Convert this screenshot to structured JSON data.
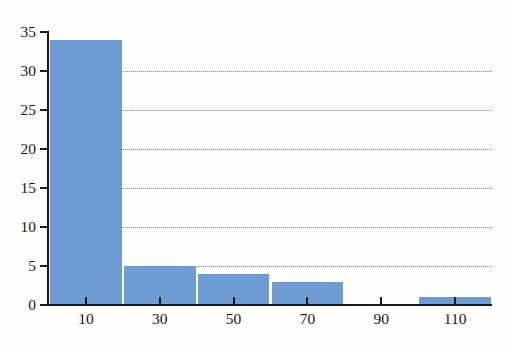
{
  "chart_data": {
    "type": "bar",
    "title": "",
    "subtitle": "",
    "xlabel": "",
    "ylabel": "",
    "xlim": [
      0,
      120
    ],
    "ylim": [
      0,
      35
    ],
    "grid": true,
    "legend": null,
    "bar_color": "#6e9bd1",
    "bin_width": 20,
    "bin_edges": [
      0,
      20,
      40,
      60,
      80,
      100,
      120
    ],
    "categories": [
      "0-20",
      "20-40",
      "40-60",
      "60-80",
      "80-100",
      "100-120"
    ],
    "values": [
      34,
      5,
      4,
      3,
      0,
      1
    ],
    "x_ticks": [
      10,
      30,
      50,
      70,
      90,
      110
    ],
    "x_tick_labels": [
      "10",
      "30",
      "50",
      "70",
      "90",
      "110"
    ],
    "y_ticks": [
      0,
      5,
      10,
      15,
      20,
      25,
      30,
      35
    ],
    "y_tick_labels": [
      "0",
      "5",
      "10",
      "15",
      "20",
      "25",
      "30",
      "35"
    ],
    "gridline_values": [
      5,
      10,
      15,
      20,
      25,
      30
    ]
  },
  "colors": {
    "background": "#fdfdfa",
    "axis": "#1b1b1b",
    "gridline": "#8a8a8a",
    "bar_fill": "#6e9bd1",
    "text": "#1a1a1a"
  }
}
